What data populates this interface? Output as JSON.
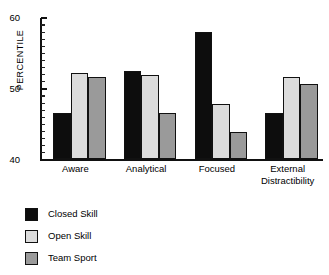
{
  "chart_data": {
    "type": "bar",
    "title": "",
    "subtitle": "",
    "xlabel": "",
    "ylabel": "PERCENTILE",
    "ylim": [
      40,
      60
    ],
    "ytick_labels": [
      "60",
      "50",
      "40"
    ],
    "ytick_values": [
      60,
      50,
      40
    ],
    "minor_tick_step": 1,
    "grid": false,
    "legend_position": "below-left",
    "categories": [
      "Aware",
      "Analytical",
      "Focused",
      "External Distractibility"
    ],
    "category_label_lines": [
      [
        "Aware"
      ],
      [
        "Analytical"
      ],
      [
        "Focused"
      ],
      [
        "External",
        "Distractibility"
      ]
    ],
    "series": [
      {
        "name": "Closed Skill",
        "color": "#0d0d0d",
        "values": [
          46.5,
          52.4,
          57.9,
          46.5
        ]
      },
      {
        "name": "Open Skill",
        "color": "#dcdcdc",
        "values": [
          52.1,
          51.9,
          47.8,
          51.6
        ]
      },
      {
        "name": "Team Sport",
        "color": "#9a9a9a",
        "values": [
          51.6,
          46.5,
          43.8,
          50.6
        ]
      }
    ]
  },
  "axis": {
    "y_title": "PERCENTILE"
  },
  "legend": {
    "items": [
      {
        "label": "Closed Skill"
      },
      {
        "label": "Open Skill"
      },
      {
        "label": "Team Sport"
      }
    ]
  }
}
